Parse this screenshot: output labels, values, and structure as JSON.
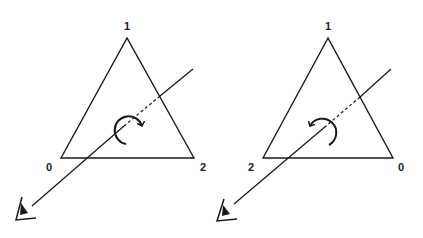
{
  "diagram": {
    "panels": [
      {
        "id": "left",
        "winding": "clockwise",
        "vertex_labels": {
          "top": "1",
          "bottom_left": "0",
          "bottom_right": "2"
        }
      },
      {
        "id": "right",
        "winding": "counter-clockwise",
        "vertex_labels": {
          "top": "1",
          "bottom_left": "2",
          "bottom_right": "0"
        }
      }
    ],
    "icons": [
      "eye-icon",
      "rotation-arrow-icon"
    ],
    "colors": {
      "line": "#1a1a1a",
      "background": "#ffffff"
    }
  }
}
